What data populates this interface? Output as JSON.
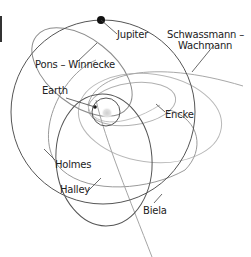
{
  "diagram": {
    "colors": {
      "dark_orbit": "#555555",
      "mid_orbit": "#8a8a8a",
      "light_orbit": "#b5b5b5",
      "leader": "#444444",
      "text": "#222222",
      "sun": "#d9d9d9"
    },
    "labels": {
      "jupiter": "Jupiter",
      "schwassmann_line1": "Schwassmann –",
      "schwassmann_line2": "Wachmann",
      "pons_winnecke": "Pons – Winnecke",
      "earth": "Earth",
      "encke": "Encke",
      "holmes": "Holmes",
      "halley": "Halley",
      "biela": "Biela"
    },
    "bodies": [
      {
        "name": "Sun",
        "shape": "glow"
      },
      {
        "name": "Earth",
        "shape": "dot"
      },
      {
        "name": "Jupiter",
        "shape": "dot"
      }
    ],
    "orbits": [
      "Earth",
      "Jupiter",
      "Pons – Winnecke",
      "Holmes",
      "Halley",
      "Encke",
      "Biela",
      "Schwassmann – Wachmann"
    ]
  }
}
